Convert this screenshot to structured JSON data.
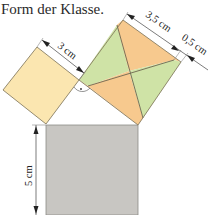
{
  "caption": "Form der Klasse.",
  "labels": {
    "small_side": "3 cm",
    "large_side_a": "3,5 cm",
    "large_side_b": "0,5 cm",
    "bottom_side": "5 cm",
    "right_angle_mark": "·"
  },
  "colors": {
    "small_square": "#fbe6b0",
    "green_piece": "#cfe3a6",
    "orange_piece": "#f7c98e",
    "gray_square": "#c8c6c2",
    "outline": "#6e6650",
    "dimension_line": "#555555"
  }
}
